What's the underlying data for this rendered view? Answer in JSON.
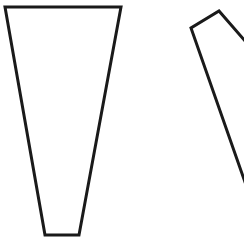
{
  "canvas": {
    "width": 244,
    "height": 250,
    "background": "#ffffff"
  },
  "stroke": {
    "color": "#1a1a1a",
    "width": 3
  },
  "shapes": [
    {
      "name": "trapezoid-left",
      "type": "polygon",
      "points": "5,7 121,7 79,235 45,235"
    },
    {
      "name": "quadrilateral-right-partial",
      "type": "polyline",
      "points": "246,42 219,11 191,28 246,185"
    }
  ]
}
